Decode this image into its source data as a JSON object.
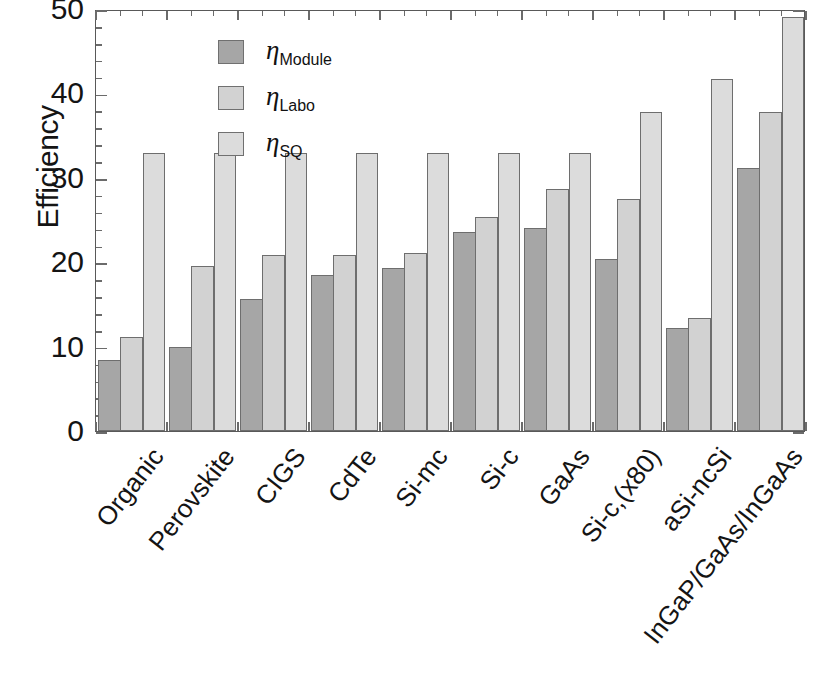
{
  "chart_data": {
    "type": "bar",
    "title": "",
    "xlabel": "",
    "ylabel": "Efficiency",
    "ylim": [
      0,
      50
    ],
    "yticks": [
      0,
      10,
      20,
      30,
      40,
      50
    ],
    "minor_tick_step": 2,
    "grid": false,
    "legend_position": "upper left",
    "categories": [
      "Organic",
      "Perovskite",
      "CIGS",
      "CdTe",
      "Si-mc",
      "Si-c",
      "GaAs",
      "Si-c,(x80)",
      "aSi-ncSi",
      "InGaP/GaAs/InGaAs"
    ],
    "series": [
      {
        "name": "eta_Module",
        "label_base": "η",
        "label_sub": "Module",
        "color": "#a6a6a6",
        "values": [
          8.4,
          9.9,
          15.6,
          18.5,
          19.3,
          23.6,
          24.0,
          20.4,
          12.2,
          31.2
        ]
      },
      {
        "name": "eta_Labo",
        "label_base": "η",
        "label_sub": "Labo",
        "color": "#d2d2d2",
        "values": [
          11.1,
          19.5,
          20.9,
          20.9,
          21.1,
          25.4,
          28.7,
          27.5,
          13.4,
          37.8
        ]
      },
      {
        "name": "eta_SQ",
        "label_base": "η",
        "label_sub": "SQ",
        "color": "#dcdcdc",
        "values": [
          32.9,
          32.9,
          32.9,
          32.9,
          32.9,
          32.9,
          32.9,
          37.8,
          41.7,
          49.0
        ]
      }
    ]
  },
  "axes": {
    "y_title": "Efficiency",
    "y_tick_labels": [
      "50",
      "40",
      "30",
      "20",
      "10",
      "0"
    ]
  },
  "colors": {
    "module": "#a6a6a6",
    "labo": "#d2d2d2",
    "sq": "#dcdcdc",
    "frame": "#595959",
    "text": "#141414",
    "background": "#ffffff"
  }
}
